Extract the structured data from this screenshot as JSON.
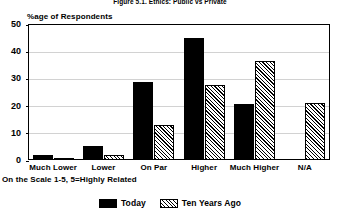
{
  "figure": {
    "title": "Figure 5.1. Ethics: Public vs Private",
    "y_axis_caption": "%age of Respondents",
    "footnote": "On the Scale 1-5, 5=Highly Related"
  },
  "legend": {
    "items": [
      {
        "label": "Today",
        "swatch": "solid-black-swatch"
      },
      {
        "label": "Ten Years Ago",
        "swatch": "hatched-swatch"
      }
    ]
  },
  "chart_data": {
    "type": "bar",
    "title": "Figure 5.1. Ethics: Public vs Private",
    "subtitle": "",
    "xlabel": "",
    "ylabel": "%age of Respondents",
    "ylim": [
      0,
      50
    ],
    "yticks": [
      0,
      10,
      20,
      30,
      40,
      50
    ],
    "ytick_labels": [
      "0",
      "10",
      "20",
      "30",
      "40",
      "50"
    ],
    "grid": true,
    "legend_position": "bottom-center",
    "annotation": "On the Scale 1-5, 5=Highly Related",
    "categories": [
      "Much Lower",
      "Lower",
      "On Par",
      "Higher",
      "Much Higher",
      "N/A"
    ],
    "series": [
      {
        "name": "Today",
        "values": [
          2,
          5,
          28.5,
          45,
          20.5,
          0
        ]
      },
      {
        "name": "Ten Years Ago",
        "values": [
          0.7,
          2,
          13,
          27.5,
          36.5,
          21
        ]
      }
    ]
  }
}
